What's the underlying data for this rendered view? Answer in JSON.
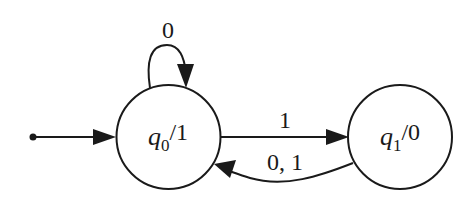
{
  "diagram": {
    "type": "moore-machine",
    "colors": {
      "stroke": "#1a1a1a",
      "background": "#ffffff"
    },
    "states": [
      {
        "id": "q0",
        "name": "q",
        "subscript": "0",
        "output": "/1",
        "initial": true
      },
      {
        "id": "q1",
        "name": "q",
        "subscript": "1",
        "output": "/0",
        "initial": false
      }
    ],
    "transitions": [
      {
        "from": "q0",
        "to": "q0",
        "label": "0"
      },
      {
        "from": "q0",
        "to": "q1",
        "label": "1"
      },
      {
        "from": "q1",
        "to": "q0",
        "label": "0, 1"
      }
    ]
  }
}
